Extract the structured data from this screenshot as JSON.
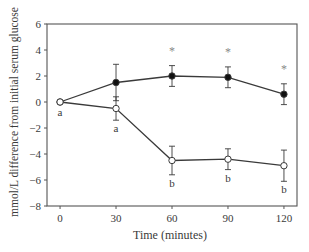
{
  "chart_data": {
    "type": "line",
    "title": "",
    "xlabel": "Time (minutes)",
    "ylabel": "mmol/L difference from initial serum glucose",
    "x": [
      0,
      30,
      60,
      90,
      120
    ],
    "xticks": [
      "0",
      "30",
      "60",
      "90",
      "120"
    ],
    "yticks": [
      "6",
      "4",
      "2",
      "0",
      "−2",
      "−4",
      "−6",
      "−8"
    ],
    "ylim": [
      -8,
      6
    ],
    "xlim": [
      -7,
      127
    ],
    "grid": false,
    "legend": null,
    "series": [
      {
        "name": "filled-circle series",
        "marker": "filled-circle",
        "values": [
          0,
          1.5,
          2.0,
          1.9,
          0.6
        ],
        "err": [
          0,
          1.4,
          0.8,
          0.8,
          0.8
        ],
        "annotations": [
          "",
          "",
          "*",
          "*",
          "*"
        ]
      },
      {
        "name": "open-circle series",
        "marker": "open-circle",
        "values": [
          0,
          -0.5,
          -4.5,
          -4.4,
          -4.9
        ],
        "err": [
          0,
          0.9,
          1.1,
          0.8,
          1.2
        ],
        "annotations": [
          "a",
          "a",
          "b",
          "b",
          "b"
        ]
      }
    ],
    "colors": {
      "line": "#3a3a3a",
      "axis": "#555555",
      "star": "#888888"
    }
  }
}
